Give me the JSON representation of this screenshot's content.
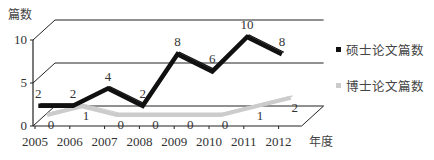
{
  "chart_data": {
    "type": "line",
    "style": "3d-perspective",
    "ylabel": "篇数",
    "xlabel": "年度",
    "categories": [
      "2005",
      "2006",
      "2007",
      "2008",
      "2009",
      "2010",
      "2011",
      "2012"
    ],
    "yticks": [
      "0",
      "5",
      "10"
    ],
    "ylim": [
      0,
      10
    ],
    "grid": true,
    "legend_position": "right",
    "series": [
      {
        "name": "硕士论文篇数",
        "color": "#111111",
        "values": [
          2,
          2,
          4,
          2,
          8,
          6,
          10,
          8
        ]
      },
      {
        "name": "博士论文篇数",
        "color": "#cccccc",
        "values": [
          0,
          1,
          0,
          0,
          0,
          0,
          1,
          2
        ]
      }
    ]
  },
  "legend": {
    "master": "硕士论文篇数",
    "phd": "博士论文篇数"
  },
  "axis": {
    "ylabel": "篇数",
    "xlabel": "年度"
  }
}
